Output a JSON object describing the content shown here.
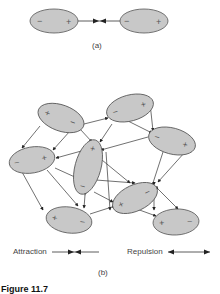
{
  "part_a": {
    "label": "(a)",
    "dipoles": [
      {
        "cx": 54,
        "cy": 21,
        "rx": 24,
        "ry": 12,
        "rot": 0,
        "left_sign": "−",
        "right_sign": "+"
      },
      {
        "cx": 144,
        "cy": 21,
        "rx": 24,
        "ry": 12,
        "rot": 0,
        "left_sign": "−",
        "right_sign": "+"
      }
    ],
    "interaction": "attraction"
  },
  "part_b": {
    "label": "(b)",
    "dipoles": [
      {
        "id": "top-left",
        "cx": 61,
        "cy": 118,
        "rx": 24,
        "ry": 13,
        "rot": 20,
        "signs": [
          "+",
          "−"
        ]
      },
      {
        "id": "top-right",
        "cx": 130,
        "cy": 108,
        "rx": 24,
        "ry": 13,
        "rot": -15,
        "signs": [
          "−",
          "+"
        ]
      },
      {
        "id": "right-mid",
        "cx": 172,
        "cy": 141,
        "rx": 24,
        "ry": 13,
        "rot": 15,
        "signs": [
          "−",
          "+"
        ]
      },
      {
        "id": "left-mid",
        "cx": 32,
        "cy": 160,
        "rx": 23,
        "ry": 13,
        "rot": -10,
        "signs": [
          "−",
          "+"
        ]
      },
      {
        "id": "center",
        "cx": 88,
        "cy": 167,
        "rx": 13,
        "ry": 28,
        "rot": 15,
        "signs": [
          "+",
          "−"
        ]
      },
      {
        "id": "lower-center",
        "cx": 135,
        "cy": 198,
        "rx": 24,
        "ry": 13,
        "rot": -25,
        "signs": [
          "−",
          "+"
        ]
      },
      {
        "id": "bottom-left",
        "cx": 69,
        "cy": 220,
        "rx": 23,
        "ry": 13,
        "rot": 8,
        "signs": [
          "+",
          "−"
        ]
      },
      {
        "id": "bottom-right",
        "cx": 176,
        "cy": 222,
        "rx": 23,
        "ry": 13,
        "rot": -3,
        "signs": [
          "+",
          "−"
        ]
      }
    ]
  },
  "legend": {
    "attraction_label": "Attraction",
    "repulsion_label": "Repulsion"
  },
  "caption": {
    "text": "Figure 11.7"
  },
  "colors": {
    "ellipse_fill": "#c8c8c8",
    "ellipse_stroke": "#555555",
    "line": "#333333"
  }
}
